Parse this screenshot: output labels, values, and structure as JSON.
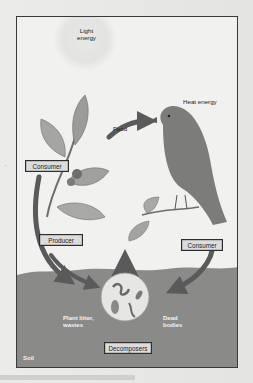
{
  "figure": {
    "labels": {
      "light_energy": "Light\nenergy",
      "light_energy_line1": "Light",
      "light_energy_line2": "energy",
      "heat_energy": "Heat energy",
      "food": "Food",
      "plant_litter_line1": "Plant litter,",
      "plant_litter_line2": "wastes",
      "dead_bodies_line1": "Dead",
      "dead_bodies_line2": "bodies",
      "soil": "Soil"
    },
    "boxes": {
      "consumer_left": "Consumer",
      "producer": "Producer",
      "consumer_right": "Consumer",
      "decomposers": "Decomposers"
    },
    "colors": {
      "arrow": "#5a5a5a",
      "soil": "#8a8a88",
      "box_fill": "#dcdcdc",
      "frame_bg": "#f1f1ef"
    }
  },
  "background_page": {
    "stray_mark": "·"
  }
}
